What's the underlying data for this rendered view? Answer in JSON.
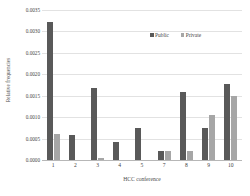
{
  "chart_data": {
    "type": "bar",
    "title": "",
    "subtitle": "",
    "xlabel": "HCC conference",
    "ylabel": "Relative frequencies",
    "categories": [
      "1",
      "2",
      "3",
      "4",
      "5",
      "7",
      "8",
      "9",
      "10"
    ],
    "series": [
      {
        "name": "Public",
        "color": "#595959",
        "values": [
          0.00322,
          0.00059,
          0.00169,
          0.00041,
          0.00074,
          0.0002,
          0.00159,
          0.00074,
          0.00178
        ]
      },
      {
        "name": "Private",
        "color": "#A6A6A6",
        "values": [
          0.0006,
          0.0,
          4e-05,
          0.0,
          0.0,
          0.0002,
          0.00021,
          0.00105,
          0.0015
        ]
      }
    ],
    "ylim": [
      0.0,
      0.0035
    ],
    "ytick_step": 0.0005,
    "ytick_labels": [
      "0.0035",
      "0.0030",
      "0.0025",
      "0.0020",
      "0.0015",
      "0.0010",
      "0.0005",
      "0.0000"
    ],
    "ytick_values": [
      0.0035,
      0.003,
      0.0025,
      0.002,
      0.0015,
      0.001,
      0.0005,
      0.0
    ],
    "grid": true,
    "grid_axis": "y",
    "legend_position": "top-right-inside",
    "legend": [
      "Public",
      "Private"
    ],
    "annotations": []
  },
  "legend": {
    "items": [
      {
        "label": "Public",
        "marker": "square-marker-dark"
      },
      {
        "label": "Private",
        "marker": "square-marker-light"
      }
    ]
  }
}
